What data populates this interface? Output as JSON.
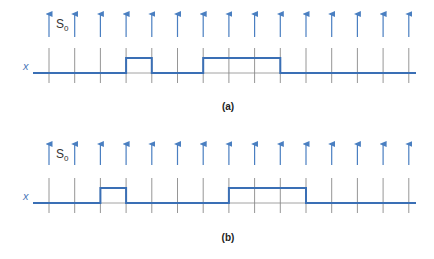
{
  "colors": {
    "arrow": "#4a7fc1",
    "tick": "#8a8a8a",
    "signal": "#3a6fb5",
    "label": "#4a78b8",
    "caption": "#222222"
  },
  "ticks": {
    "x_start": 49,
    "spacing": 25.7,
    "count": 15
  },
  "panels": [
    {
      "id": "a",
      "caption": "(a)",
      "signal_label": "x",
      "sample_label": "S",
      "sample_sub": "0",
      "arrow_top": 10,
      "arrow_bottom": 37,
      "tick_top": 48,
      "tick_bottom": 83,
      "baseline_y": 73,
      "high_y": 58,
      "line_x_start": 33,
      "line_x_end": 416,
      "pulses": [
        {
          "from_tick": 3,
          "to_tick": 4
        },
        {
          "from_tick": 6,
          "to_tick": 9
        }
      ],
      "caption_y": 110
    },
    {
      "id": "b",
      "caption": "(b)",
      "signal_label": "x",
      "sample_label": "S",
      "sample_sub": "0",
      "arrow_top": 140,
      "arrow_bottom": 165,
      "tick_top": 178,
      "tick_bottom": 213,
      "baseline_y": 203,
      "high_y": 188,
      "line_x_start": 33,
      "line_x_end": 416,
      "pulses": [
        {
          "from_tick": 2,
          "to_tick": 3
        },
        {
          "from_tick": 7,
          "to_tick": 10
        }
      ],
      "caption_y": 241
    }
  ]
}
